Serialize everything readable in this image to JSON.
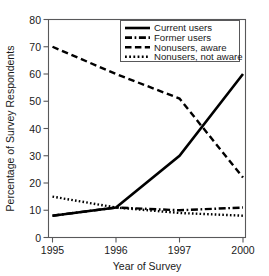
{
  "chart_data": {
    "type": "line",
    "title": "",
    "xlabel": "Year of Survey",
    "ylabel": "Percentage of Survey Respondents",
    "x": [
      "1995",
      "1996",
      "1997",
      "2000"
    ],
    "xtick_labels": [
      "1995",
      "1996",
      "1997",
      "2000"
    ],
    "ytick_labels": [
      "0",
      "10",
      "20",
      "30",
      "40",
      "50",
      "60",
      "70",
      "80"
    ],
    "ylim": [
      0,
      80
    ],
    "ytick_step": 10,
    "grid": false,
    "legend_position": "top-right",
    "series": [
      {
        "name": "Current users",
        "style": "solid",
        "color": "#000000",
        "values": [
          8,
          11,
          30,
          60
        ]
      },
      {
        "name": "Former users",
        "style": "dash-dot",
        "color": "#000000",
        "values": [
          8,
          11,
          10,
          11
        ]
      },
      {
        "name": "Nonusers, aware",
        "style": "dashed",
        "color": "#000000",
        "values": [
          70,
          60,
          51,
          22
        ]
      },
      {
        "name": "Nonusers, not aware",
        "style": "dotted",
        "color": "#000000",
        "values": [
          15,
          11,
          9,
          8
        ]
      }
    ]
  },
  "legend": {
    "entries": [
      {
        "label": "Current users",
        "style": "solid"
      },
      {
        "label": "Former users",
        "style": "dash-dot"
      },
      {
        "label": "Nonusers, aware",
        "style": "dashed"
      },
      {
        "label": "Nonusers, not aware",
        "style": "dotted"
      }
    ]
  },
  "axes": {
    "y_title": "Percentage of Survey Respondents",
    "x_title": "Year of Survey",
    "y_ticks": [
      "80",
      "70",
      "60",
      "50",
      "40",
      "30",
      "20",
      "10",
      "0"
    ],
    "x_ticks": [
      "1995",
      "1996",
      "1997",
      "2000"
    ]
  }
}
